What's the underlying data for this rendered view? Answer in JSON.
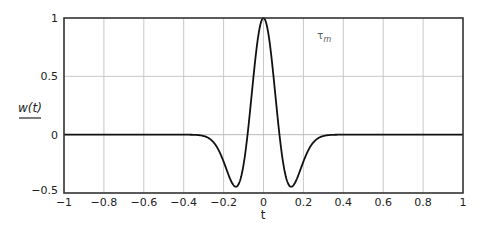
{
  "chart_data": {
    "type": "line",
    "title": "",
    "xlabel": "t",
    "ylabel": "w(t)",
    "xlim": [
      -1,
      1
    ],
    "ylim": [
      -0.5,
      1
    ],
    "grid": true,
    "legend": null,
    "x_ticks": [
      -1,
      -0.8,
      -0.6,
      -0.4,
      -0.2,
      0,
      0.2,
      0.4,
      0.6,
      0.8,
      1
    ],
    "x_tick_labels": [
      "−1",
      "−0.8",
      "−0.6",
      "−0.4",
      "−0.2",
      "0",
      "0.2",
      "0.4",
      "0.6",
      "0.8",
      "1"
    ],
    "y_ticks": [
      -0.5,
      0,
      0.5,
      1
    ],
    "y_tick_labels": [
      "−0.5",
      "0",
      "0.5",
      "1"
    ],
    "annotations": [
      {
        "text": "τ",
        "sub": "m",
        "x": 0.27,
        "y": 0.82
      }
    ],
    "series": [
      {
        "name": "w(t)",
        "color": "#111111",
        "description": "Mexican-hat (Ricker) wavelet, peak 1 at t=0, minima about -0.45 at t=±0.14",
        "sigma": 0.08,
        "x": [
          -1,
          -0.5,
          -0.4,
          -0.35,
          -0.3,
          -0.28,
          -0.26,
          -0.24,
          -0.22,
          -0.2,
          -0.18,
          -0.16,
          -0.14,
          -0.12,
          -0.1,
          -0.08,
          -0.06,
          -0.04,
          -0.02,
          0,
          0.02,
          0.04,
          0.06,
          0.08,
          0.1,
          0.12,
          0.14,
          0.16,
          0.18,
          0.2,
          0.22,
          0.24,
          0.26,
          0.28,
          0.3,
          0.35,
          0.4,
          0.5,
          1
        ],
        "y": [
          0,
          0,
          -0.0001,
          -0.0012,
          -0.0115,
          -0.0248,
          -0.0496,
          -0.0889,
          -0.1444,
          -0.2103,
          -0.2869,
          -0.3518,
          -0.4454,
          -0.407,
          -0.2567,
          0,
          0.3323,
          0.6619,
          0.9077,
          1,
          0.9077,
          0.6619,
          0.3323,
          0,
          -0.2567,
          -0.407,
          -0.4454,
          -0.3518,
          -0.2869,
          -0.2103,
          -0.1444,
          -0.0889,
          -0.0496,
          -0.0248,
          -0.0115,
          -0.0012,
          -0.0001,
          0,
          0
        ]
      }
    ]
  }
}
